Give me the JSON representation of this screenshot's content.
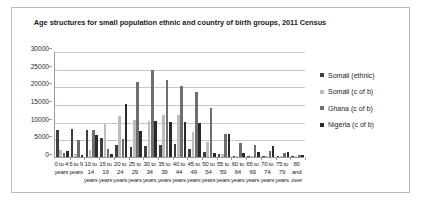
{
  "chart_data": {
    "type": "bar",
    "title": "Age structures for small population ethnic and country of birth groups, 2011 Census",
    "title_line1": "Age structures for small population ethnic and country of birth groups,",
    "title_line2": "2011 Census",
    "xlabel": "",
    "ylabel": "",
    "ylim": [
      0,
      30000
    ],
    "ytick_values": [
      0,
      5000,
      10000,
      15000,
      20000,
      25000,
      30000
    ],
    "ytick_labels": [
      "0",
      "5000",
      "10000",
      "15000",
      "20000",
      "25000",
      "30000"
    ],
    "grid": true,
    "legend_position": "right",
    "categories": [
      "0 to 4 years",
      "5 to 9 years",
      "10 to 14 years",
      "15 to 19 years",
      "20 to 24 years",
      "25 to 29 years",
      "30 to 34 years",
      "35 to 39 years",
      "40 to 44 years",
      "45 to 49 years",
      "50 to 54 years",
      "55 to 59 years",
      "60 to 64 years",
      "65 to 69 years",
      "70 to 74 years",
      "75 to 79 years",
      "80 and over"
    ],
    "category_label_lines": [
      [
        "0 to 4",
        "years"
      ],
      [
        "5 to 9",
        "years"
      ],
      [
        "10 to",
        "14",
        "years"
      ],
      [
        "15 to",
        "19",
        "years"
      ],
      [
        "20 to",
        "24",
        "years"
      ],
      [
        "25 to",
        "29",
        "years"
      ],
      [
        "30 to",
        "34",
        "years"
      ],
      [
        "35 to",
        "39",
        "years"
      ],
      [
        "40 to",
        "44",
        "years"
      ],
      [
        "45 to",
        "49",
        "years"
      ],
      [
        "50 to",
        "54",
        "years"
      ],
      [
        "55 to",
        "59",
        "years"
      ],
      [
        "60 to",
        "64",
        "years"
      ],
      [
        "65 to",
        "69",
        "years"
      ],
      [
        "70 to",
        "74",
        "years"
      ],
      [
        "75 to",
        "79",
        "years"
      ],
      [
        "80",
        "and",
        "over"
      ]
    ],
    "series": [
      {
        "name": "Somali (ethnic)",
        "color": "#3f3f3f",
        "values": [
          7700,
          7800,
          7700,
          5400,
          3300,
          2700,
          3000,
          3500,
          3800,
          2200,
          1400,
          800,
          400,
          250,
          400,
          250,
          200
        ]
      },
      {
        "name": "Somali (c of b)",
        "color": "#bcbcbc",
        "values": [
          1900,
          800,
          1900,
          9400,
          11500,
          10400,
          10200,
          11900,
          11800,
          7100,
          4300,
          900,
          300,
          200,
          400,
          200,
          200
        ]
      },
      {
        "name": "Ghana (c of b)",
        "color": "#6e6e6e",
        "values": [
          1000,
          4900,
          7600,
          2300,
          5000,
          21200,
          24500,
          21700,
          20200,
          18400,
          14000,
          6500,
          4000,
          3300,
          1800,
          1100,
          600
        ]
      },
      {
        "name": "Nigeria (c of b)",
        "color": "#2a2a2a",
        "values": [
          1800,
          600,
          6100,
          900,
          15000,
          7400,
          10200,
          9800,
          10000,
          9700,
          1000,
          6400,
          1200,
          1500,
          3200,
          1300,
          500
        ]
      }
    ]
  },
  "legend": {
    "items": [
      {
        "label": "Somali (ethnic)"
      },
      {
        "label": "Somali (c of b)"
      },
      {
        "label": "Ghana (c of b)"
      },
      {
        "label": "Nigeria (c of b)"
      }
    ]
  }
}
